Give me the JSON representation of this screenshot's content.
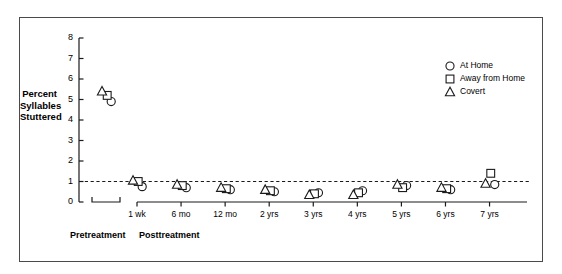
{
  "chart_data": {
    "type": "scatter",
    "title": "",
    "xlabel": "",
    "ylabel": "Percent Syllables Stuttered",
    "ylabel_lines": [
      "Percent",
      "Syllables",
      "Stuttered"
    ],
    "ylim": [
      0,
      8
    ],
    "yticks": [
      0,
      1,
      2,
      3,
      4,
      5,
      6,
      7,
      8
    ],
    "ytick_labels": [
      "0",
      "1",
      "2",
      "3",
      "4",
      "5",
      "6",
      "7",
      "8"
    ],
    "grid": false,
    "legend_position": "top-right",
    "reference_line": {
      "value": 1.0,
      "style": "dashed",
      "label": ""
    },
    "phases": [
      {
        "name": "Pretreatment",
        "categories": [
          ""
        ]
      },
      {
        "name": "Posttreatment",
        "categories": [
          "1 wk",
          "6 mo",
          "12 mo",
          "2 yrs",
          "3 yrs",
          "4 yrs",
          "5 yrs",
          "6 yrs",
          "7 yrs"
        ]
      }
    ],
    "categories": [
      "Pretreatment",
      "1 wk",
      "6 mo",
      "12 mo",
      "2 yrs",
      "3 yrs",
      "4 yrs",
      "5 yrs",
      "6 yrs",
      "7 yrs"
    ],
    "series": [
      {
        "name": "At Home",
        "marker": "circle",
        "values": [
          4.9,
          0.75,
          0.7,
          0.6,
          0.5,
          0.45,
          0.55,
          0.8,
          0.6,
          0.85
        ]
      },
      {
        "name": "Away from Home",
        "marker": "square",
        "values": [
          5.2,
          1.0,
          0.8,
          0.65,
          0.55,
          0.4,
          0.45,
          0.7,
          0.65,
          1.4
        ]
      },
      {
        "name": "Covert",
        "marker": "triangle",
        "values": [
          5.4,
          1.05,
          0.85,
          0.7,
          0.6,
          0.35,
          0.35,
          0.85,
          0.7,
          0.9
        ]
      }
    ]
  },
  "legend": {
    "items": [
      {
        "label": "At Home",
        "marker": "circle"
      },
      {
        "label": "Away from Home",
        "marker": "square"
      },
      {
        "label": "Covert",
        "marker": "triangle"
      }
    ]
  }
}
